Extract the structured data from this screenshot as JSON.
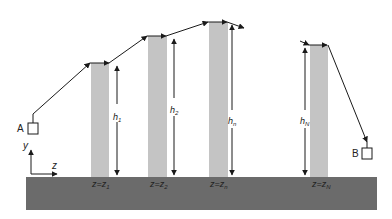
{
  "diagram": {
    "type": "cable path over towers (elevation profile)",
    "colors": {
      "ground": "#6b6b6b",
      "tower": "#c4c4c4",
      "line": "#1a1a1a",
      "background": "#ffffff"
    },
    "endpoints": {
      "A": {
        "label": "A"
      },
      "B": {
        "label": "B"
      }
    },
    "axes": {
      "y_label": "y",
      "z_label": "z"
    },
    "towers": [
      {
        "height_label": "h",
        "height_sub": "1",
        "pos_label": "z=z",
        "pos_sub": "1"
      },
      {
        "height_label": "h",
        "height_sub": "2",
        "pos_label": "z=z",
        "pos_sub": "2"
      },
      {
        "height_label": "h",
        "height_sub": "n",
        "pos_label": "z=z",
        "pos_sub": "n"
      },
      {
        "height_label": "h",
        "height_sub": "N",
        "pos_label": "z=z",
        "pos_sub": "N"
      }
    ]
  }
}
